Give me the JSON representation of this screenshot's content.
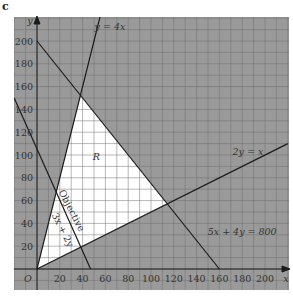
{
  "panel_label": "c",
  "chart_data": {
    "type": "line",
    "title": "",
    "xlabel": "x",
    "ylabel": "y",
    "origin_label": "O",
    "xlim": [
      -20,
      220
    ],
    "ylim": [
      -18,
      220
    ],
    "x_ticks": [
      20,
      40,
      60,
      80,
      100,
      120,
      140,
      160,
      180,
      200
    ],
    "y_ticks": [
      20,
      40,
      60,
      80,
      100,
      120,
      140,
      160,
      180,
      200
    ],
    "grid": true,
    "grid_spacing": 10,
    "series": [
      {
        "name": "y = 4x",
        "points": [
          [
            0,
            0
          ],
          [
            57,
            228
          ]
        ]
      },
      {
        "name": "2y = x",
        "points": [
          [
            0,
            0
          ],
          [
            220,
            110
          ]
        ]
      },
      {
        "name": "5x + 4y = 800",
        "points": [
          [
            0,
            200
          ],
          [
            160,
            0
          ]
        ]
      },
      {
        "name": "Objective 3x + 2y",
        "points": [
          [
            -20,
            150
          ],
          [
            47,
            0
          ]
        ]
      }
    ],
    "feasible_region": {
      "label": "R",
      "vertices": [
        [
          0,
          0
        ],
        [
          38.1,
          152.4
        ],
        [
          114.3,
          57.1
        ]
      ]
    },
    "annotations": [
      {
        "text": "y = 4x",
        "x": 64,
        "y": 210
      },
      {
        "text": "2y = x",
        "x": 185,
        "y": 100
      },
      {
        "text": "5x + 4y = 800",
        "x": 180,
        "y": 30
      },
      {
        "text": "R",
        "x": 52,
        "y": 96
      },
      {
        "text": "Objective",
        "x": 28,
        "y": 50
      },
      {
        "text": "3x + 2y",
        "x": 20,
        "y": 33
      }
    ]
  }
}
